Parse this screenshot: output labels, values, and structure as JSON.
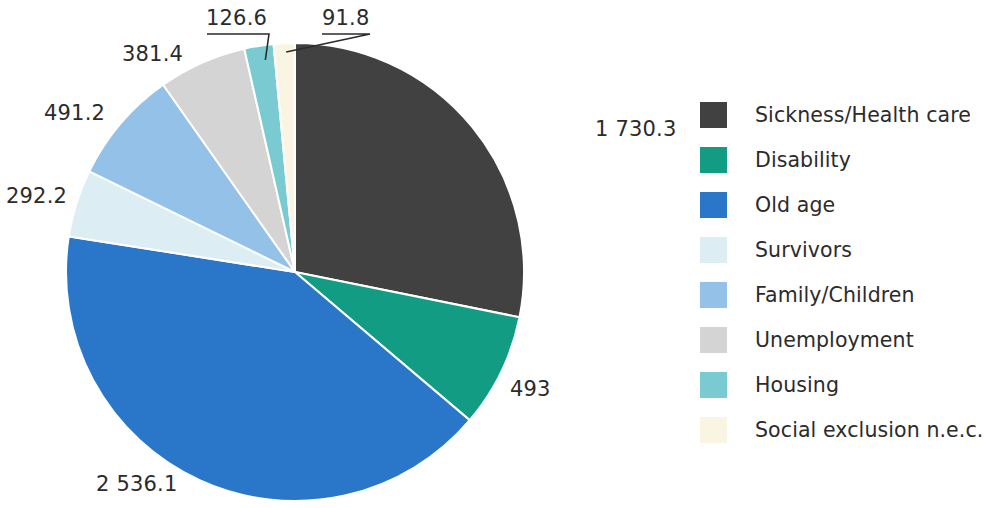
{
  "chart_data": {
    "type": "pie",
    "title": "",
    "subtitle": "",
    "xlabel": "",
    "ylabel": "",
    "legend_position": "right",
    "grid": false,
    "total": 6142.6,
    "start_angle_deg": 0,
    "direction": "clockwise",
    "categories": [
      "Sickness/Health care",
      "Disability",
      "Old age",
      "Survivors",
      "Family/Children",
      "Unemployment",
      "Housing",
      "Social exclusion n.e.c."
    ],
    "values": [
      1730.3,
      493,
      2536.1,
      292.2,
      491.2,
      381.4,
      126.6,
      91.8
    ],
    "value_labels": [
      "1 730.3",
      "493",
      "2 536.1",
      "292.2",
      "491.2",
      "381.4",
      "126.6",
      "91.8"
    ],
    "colors": [
      "#414141",
      "#139C84",
      "#2A76C8",
      "#DCEEF4",
      "#94C1E8",
      "#D4D4D4",
      "#79CBD1",
      "#FAF5E2"
    ]
  },
  "slices": [
    {
      "name": "Sickness/Health care",
      "value": 1730.3,
      "label": "1 730.3",
      "color": "#414141",
      "label_x": 595,
      "label_y": 117,
      "has_leader": false
    },
    {
      "name": "Disability",
      "value": 493,
      "label": "493",
      "color": "#139C84",
      "label_x": 510,
      "label_y": 377,
      "has_leader": false
    },
    {
      "name": "Old age",
      "value": 2536.1,
      "label": "2 536.1",
      "color": "#2A76C8",
      "label_x": 96,
      "label_y": 472,
      "has_leader": false
    },
    {
      "name": "Survivors",
      "value": 292.2,
      "label": "292.2",
      "color": "#DCEEF4",
      "label_x": 6,
      "label_y": 184,
      "has_leader": false
    },
    {
      "name": "Family/Children",
      "value": 491.2,
      "label": "491.2",
      "color": "#94C1E8",
      "label_x": 44,
      "label_y": 101,
      "has_leader": false
    },
    {
      "name": "Unemployment",
      "value": 381.4,
      "label": "381.4",
      "color": "#D4D4D4",
      "label_x": 122,
      "label_y": 42,
      "has_leader": false
    },
    {
      "name": "Housing",
      "value": 126.6,
      "label": "126.6",
      "color": "#79CBD1",
      "label_x": 206,
      "label_y": 6,
      "has_leader": true
    },
    {
      "name": "Social exclusion n.e.c.",
      "value": 91.8,
      "label": "91.8",
      "color": "#FAF5E2",
      "label_x": 322,
      "label_y": 6,
      "has_leader": true
    }
  ],
  "legend": {
    "items": [
      {
        "label": "Sickness/Health care",
        "color": "#414141"
      },
      {
        "label": "Disability",
        "color": "#139C84"
      },
      {
        "label": "Old age",
        "color": "#2A76C8"
      },
      {
        "label": "Survivors",
        "color": "#DCEEF4"
      },
      {
        "label": "Family/Children",
        "color": "#94C1E8"
      },
      {
        "label": "Unemployment",
        "color": "#D4D4D4"
      },
      {
        "label": "Housing",
        "color": "#79CBD1"
      },
      {
        "label": "Social exclusion n.e.c.",
        "color": "#FAF5E2"
      }
    ]
  }
}
